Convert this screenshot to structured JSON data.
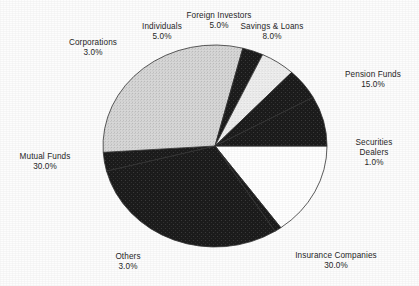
{
  "chart_data": {
    "type": "pie",
    "title": "",
    "subtitle": "",
    "xlabel": "",
    "ylabel": "",
    "legend_position": "none",
    "grid": false,
    "unit": "%",
    "labels": [
      "Pension Funds",
      "Securities Dealers",
      "Insurance Companies",
      "Others",
      "Mutual Funds",
      "Corporations",
      "Individuals",
      "Foreign Investors",
      "Savings & Loans"
    ],
    "values": [
      15.0,
      1.0,
      30.0,
      3.0,
      30.0,
      3.0,
      5.0,
      5.0,
      8.0
    ],
    "value_labels": [
      "15.0%",
      "1.0%",
      "30.0%",
      "3.0%",
      "30.0%",
      "3.0%",
      "5.0%",
      "5.0%",
      "8.0%"
    ],
    "slice_colors": [
      "#ffffff",
      "#1d1d1d",
      "#1d1d1d",
      "#1d1d1d",
      "#d6d6d6",
      "#1d1d1d",
      "#ededed",
      "#2a2a2a",
      "#1d1d1d"
    ],
    "start_angle_deg": 0,
    "direction": "clockwise",
    "total": 100.0
  },
  "slices": [
    {
      "name": "Pension Funds",
      "value": 15.0,
      "value_label": "15.0%",
      "color": "#ffffff",
      "start": 0,
      "end": 54
    },
    {
      "name": "Securities Dealers",
      "value": 1.0,
      "value_label": "1.0%",
      "color": "#1d1d1d",
      "start": 54,
      "end": 57.6
    },
    {
      "name": "Insurance Companies",
      "value": 30.0,
      "value_label": "30.0%",
      "color": "#1d1d1d",
      "start": 57.6,
      "end": 165.6
    },
    {
      "name": "Others",
      "value": 3.0,
      "value_label": "3.0%",
      "color": "#1d1d1d",
      "start": 165.6,
      "end": 176.4
    },
    {
      "name": "Mutual Funds",
      "value": 30.0,
      "value_label": "30.0%",
      "color": "#d6d6d6",
      "start": 176.4,
      "end": 284.4
    },
    {
      "name": "Corporations",
      "value": 3.0,
      "value_label": "3.0%",
      "color": "#1d1d1d",
      "start": 284.4,
      "end": 295.2
    },
    {
      "name": "Individuals",
      "value": 5.0,
      "value_label": "5.0%",
      "color": "#ededed",
      "start": 295.2,
      "end": 313.2
    },
    {
      "name": "Foreign Investors",
      "value": 5.0,
      "value_label": "5.0%",
      "color": "#2a2a2a",
      "start": 313.2,
      "end": 331.2
    },
    {
      "name": "Savings & Loans",
      "value": 8.0,
      "value_label": "8.0%",
      "color": "#1d1d1d",
      "start": 331.2,
      "end": 360
    }
  ],
  "labels": {
    "corporations": {
      "name": "Corporations",
      "value": "3.0%"
    },
    "individuals": {
      "name": "Individuals",
      "value": "5.0%"
    },
    "foreign_investors": {
      "name": "Foreign Investors",
      "value": "5.0%"
    },
    "savings_loans": {
      "name": "Savings & Loans",
      "value": "8.0%"
    },
    "pension_funds": {
      "name": "Pension Funds",
      "value": "15.0%"
    },
    "securities_dealers": {
      "name": "Securities",
      "name2": "Dealers",
      "value": "1.0%"
    },
    "insurance": {
      "name": "Insurance Companies",
      "value": "30.0%"
    },
    "others": {
      "name": "Others",
      "value": "3.0%"
    },
    "mutual_funds": {
      "name": "Mutual Funds",
      "value": "30.0%"
    }
  },
  "geometry": {
    "center_x": 215,
    "center_y": 146,
    "radius_x": 112,
    "radius_y": 101
  },
  "colors": {
    "background": "#fdfdfd",
    "dark_fill": "#1d1d1d",
    "light_fill": "#d6d6d6",
    "pale_fill": "#ededed",
    "white_fill": "#ffffff",
    "outline": "#333333",
    "text": "#262626"
  }
}
